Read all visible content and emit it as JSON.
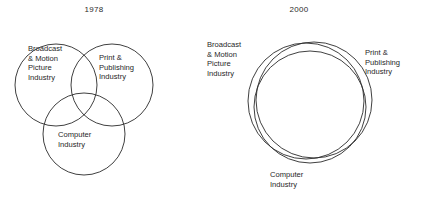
{
  "figure": {
    "type": "venn-diagram-pair",
    "background_color": "#ffffff",
    "stroke_color": "#2a2a2a",
    "text_color": "#1f1f1f"
  },
  "panels": [
    {
      "id": "1978",
      "title": "1978",
      "description": "Three partially overlapping circles forming a classic three-set Venn diagram with a small central intersection.",
      "labels": {
        "broadcast": {
          "lines": [
            "Broadcast",
            "& Motion",
            "Picture",
            "Industry"
          ],
          "placement": "inside-left-circle"
        },
        "print": {
          "lines": [
            "Print &",
            "Publishing",
            "Industry"
          ],
          "placement": "inside-right-circle"
        },
        "computer": {
          "lines": [
            "Computer",
            "Industry"
          ],
          "placement": "inside-bottom-circle"
        }
      },
      "circles": [
        {
          "name": "broadcast-motion-picture-circle",
          "cx": 56,
          "cy": 85,
          "r": 41
        },
        {
          "name": "print-publishing-circle",
          "cx": 112,
          "cy": 85,
          "r": 41
        },
        {
          "name": "computer-circle",
          "cx": 84,
          "cy": 134,
          "r": 41
        }
      ]
    },
    {
      "id": "2000",
      "title": "2000",
      "description": "Three nearly concentric circles almost completely overlapping, showing industry convergence.",
      "labels": {
        "broadcast": {
          "lines": [
            "Broadcast",
            "& Motion",
            "Picture",
            "Industry"
          ],
          "placement": "outside-left"
        },
        "print": {
          "lines": [
            "Print &",
            "Publishing",
            "Industry"
          ],
          "placement": "outside-right"
        },
        "computer": {
          "lines": [
            "Computer",
            "Industry"
          ],
          "placement": "outside-bottom"
        }
      },
      "circles": [
        {
          "name": "broadcast-motion-picture-circle",
          "cx": 93,
          "cy": 101,
          "r": 58
        },
        {
          "name": "print-publishing-circle",
          "cx": 101,
          "cy": 100,
          "r": 58
        },
        {
          "name": "computer-circle",
          "cx": 97,
          "cy": 107,
          "r": 56
        }
      ]
    }
  ]
}
